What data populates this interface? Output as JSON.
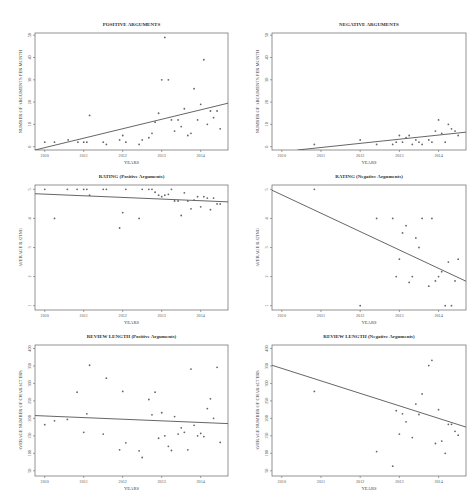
{
  "header_fragment": "",
  "chart_data": [
    {
      "id": "pos_args",
      "type": "scatter",
      "title": "POSITIVE ARGUMENTS",
      "xlabel": "YEARS",
      "ylabel": "NUMBER OF ARGUMENTS PER MONTH",
      "xticks": [
        2010,
        2011,
        2012,
        2013,
        2014
      ],
      "yticks": [
        0,
        10,
        20,
        30,
        40,
        50
      ],
      "xlim": [
        2009.75,
        2014.7
      ],
      "ylim": [
        -1.5,
        51
      ],
      "trend": [
        [
          2009.75,
          -1.5
        ],
        [
          2014.7,
          19.5
        ]
      ],
      "points": [
        [
          2010.0,
          2
        ],
        [
          2010.25,
          2
        ],
        [
          2010.6,
          3
        ],
        [
          2010.85,
          2
        ],
        [
          2011.0,
          2
        ],
        [
          2011.08,
          2
        ],
        [
          2011.15,
          14
        ],
        [
          2011.5,
          2
        ],
        [
          2011.58,
          1
        ],
        [
          2011.92,
          3
        ],
        [
          2012.0,
          5
        ],
        [
          2012.08,
          2
        ],
        [
          2012.42,
          1
        ],
        [
          2012.5,
          3
        ],
        [
          2012.67,
          4
        ],
        [
          2012.75,
          6
        ],
        [
          2012.83,
          11
        ],
        [
          2012.92,
          15
        ],
        [
          2013.0,
          30
        ],
        [
          2013.08,
          49
        ],
        [
          2013.17,
          30
        ],
        [
          2013.25,
          12
        ],
        [
          2013.33,
          7
        ],
        [
          2013.42,
          12
        ],
        [
          2013.5,
          9
        ],
        [
          2013.58,
          17
        ],
        [
          2013.67,
          5
        ],
        [
          2013.75,
          6
        ],
        [
          2013.83,
          26
        ],
        [
          2013.92,
          12
        ],
        [
          2014.0,
          19
        ],
        [
          2014.08,
          39
        ],
        [
          2014.17,
          10
        ],
        [
          2014.25,
          16
        ],
        [
          2014.33,
          13
        ],
        [
          2014.42,
          16
        ],
        [
          2014.5,
          8
        ]
      ]
    },
    {
      "id": "neg_args",
      "type": "scatter",
      "title": "NEGATIVE ARGUMENTS",
      "xlabel": "YEARS",
      "ylabel": "NUMBER OF ARGUMENTS PER MONTH",
      "xticks": [
        2010,
        2011,
        2012,
        2013,
        2014
      ],
      "yticks": [
        0,
        10,
        20,
        30,
        40,
        50
      ],
      "xlim": [
        2009.75,
        2014.7
      ],
      "ylim": [
        -1.5,
        51
      ],
      "trend": [
        [
          2010.4,
          -1.5
        ],
        [
          2014.7,
          6.5
        ]
      ],
      "points": [
        [
          2010.83,
          1
        ],
        [
          2012.0,
          3
        ],
        [
          2012.42,
          1
        ],
        [
          2012.83,
          1
        ],
        [
          2012.92,
          2
        ],
        [
          2013.0,
          5
        ],
        [
          2013.08,
          2
        ],
        [
          2013.17,
          4
        ],
        [
          2013.25,
          5
        ],
        [
          2013.33,
          1
        ],
        [
          2013.42,
          3
        ],
        [
          2013.5,
          2
        ],
        [
          2013.58,
          1
        ],
        [
          2013.75,
          3
        ],
        [
          2013.83,
          2
        ],
        [
          2013.92,
          7
        ],
        [
          2014.0,
          12
        ],
        [
          2014.08,
          6
        ],
        [
          2014.17,
          2
        ],
        [
          2014.25,
          10
        ],
        [
          2014.33,
          8
        ],
        [
          2014.42,
          7
        ],
        [
          2014.5,
          5
        ]
      ]
    },
    {
      "id": "rating_pos",
      "type": "scatter",
      "title": "RATING (Positive Arguments)",
      "xlabel": "YEARS",
      "ylabel": "AVERAGE RATING",
      "xticks": [
        2010,
        2011,
        2012,
        2013,
        2014
      ],
      "yticks": [
        1,
        2,
        3,
        4,
        5
      ],
      "ylim": [
        0.85,
        5.15
      ],
      "xlim": [
        2009.75,
        2014.7
      ],
      "trend": [
        [
          2009.75,
          4.85
        ],
        [
          2014.7,
          4.57
        ]
      ],
      "points": [
        [
          2010.0,
          5
        ],
        [
          2010.25,
          4
        ],
        [
          2010.58,
          5
        ],
        [
          2010.83,
          5
        ],
        [
          2011.0,
          5
        ],
        [
          2011.08,
          5
        ],
        [
          2011.15,
          4.8
        ],
        [
          2011.5,
          5
        ],
        [
          2011.58,
          5
        ],
        [
          2011.92,
          3.67
        ],
        [
          2012.0,
          4.2
        ],
        [
          2012.08,
          5
        ],
        [
          2012.42,
          4
        ],
        [
          2012.5,
          5
        ],
        [
          2012.67,
          5
        ],
        [
          2012.75,
          5
        ],
        [
          2012.83,
          4.9
        ],
        [
          2012.92,
          4.8
        ],
        [
          2013.0,
          4.75
        ],
        [
          2013.08,
          4.8
        ],
        [
          2013.17,
          4.83
        ],
        [
          2013.25,
          5
        ],
        [
          2013.33,
          4.6
        ],
        [
          2013.42,
          4.6
        ],
        [
          2013.5,
          4.1
        ],
        [
          2013.58,
          4.88
        ],
        [
          2013.67,
          4.6
        ],
        [
          2013.75,
          4.33
        ],
        [
          2013.83,
          4.63
        ],
        [
          2013.92,
          4.75
        ],
        [
          2014.0,
          4.4
        ],
        [
          2014.08,
          4.75
        ],
        [
          2014.17,
          4.7
        ],
        [
          2014.25,
          4.3
        ],
        [
          2014.33,
          4.7
        ],
        [
          2014.42,
          4.5
        ],
        [
          2014.5,
          4.5
        ]
      ]
    },
    {
      "id": "rating_neg",
      "type": "scatter",
      "title": "RATING (Negative Arguments)",
      "xlabel": "YEARS",
      "ylabel": "AVERAGE RATING",
      "xticks": [
        2010,
        2011,
        2012,
        2013,
        2014
      ],
      "yticks": [
        1,
        2,
        3,
        4,
        5
      ],
      "ylim": [
        0.85,
        5.15
      ],
      "xlim": [
        2009.75,
        2014.7
      ],
      "trend": [
        [
          2009.75,
          4.97
        ],
        [
          2014.7,
          1.84
        ]
      ],
      "points": [
        [
          2010.83,
          5
        ],
        [
          2012.0,
          1
        ],
        [
          2012.42,
          4
        ],
        [
          2012.83,
          4
        ],
        [
          2012.92,
          2
        ],
        [
          2013.0,
          2.6
        ],
        [
          2013.08,
          3.5
        ],
        [
          2013.17,
          3.75
        ],
        [
          2013.25,
          1.8
        ],
        [
          2013.33,
          2
        ],
        [
          2013.42,
          3.33
        ],
        [
          2013.5,
          3
        ],
        [
          2013.58,
          4
        ],
        [
          2013.75,
          1.67
        ],
        [
          2013.83,
          4
        ],
        [
          2013.92,
          1.85
        ],
        [
          2014.0,
          2
        ],
        [
          2014.08,
          2.17
        ],
        [
          2014.17,
          1
        ],
        [
          2014.25,
          2.5
        ],
        [
          2014.33,
          1
        ],
        [
          2014.42,
          1.85
        ],
        [
          2014.5,
          2.6
        ]
      ]
    },
    {
      "id": "len_pos",
      "type": "scatter",
      "title": "REVIEW LENGTH (Positive Arguments)",
      "xlabel": "YEARS",
      "ylabel": "AVERAGE NUMBER OF CHARACTERS",
      "xticks": [
        2010,
        2011,
        2012,
        2013,
        2014
      ],
      "yticks": [
        50,
        100,
        150,
        200,
        250,
        300,
        350,
        400
      ],
      "ylim": [
        35,
        410
      ],
      "xlim": [
        2009.75,
        2014.7
      ],
      "trend": [
        [
          2009.75,
          208
        ],
        [
          2014.7,
          185
        ]
      ],
      "points": [
        [
          2010.0,
          182
        ],
        [
          2010.25,
          193
        ],
        [
          2010.58,
          197
        ],
        [
          2010.83,
          275
        ],
        [
          2011.0,
          160
        ],
        [
          2011.08,
          213
        ],
        [
          2011.15,
          352
        ],
        [
          2011.5,
          155
        ],
        [
          2011.58,
          315
        ],
        [
          2011.92,
          110
        ],
        [
          2012.0,
          277
        ],
        [
          2012.08,
          130
        ],
        [
          2012.42,
          107
        ],
        [
          2012.5,
          88
        ],
        [
          2012.67,
          254
        ],
        [
          2012.75,
          210
        ],
        [
          2012.83,
          275
        ],
        [
          2012.92,
          143
        ],
        [
          2013.0,
          216
        ],
        [
          2013.08,
          150
        ],
        [
          2013.17,
          120
        ],
        [
          2013.25,
          108
        ],
        [
          2013.33,
          205
        ],
        [
          2013.42,
          155
        ],
        [
          2013.5,
          173
        ],
        [
          2013.58,
          160
        ],
        [
          2013.67,
          110
        ],
        [
          2013.75,
          341
        ],
        [
          2013.83,
          180
        ],
        [
          2013.92,
          150
        ],
        [
          2014.0,
          157
        ],
        [
          2014.08,
          148
        ],
        [
          2014.17,
          228
        ],
        [
          2014.25,
          256
        ],
        [
          2014.33,
          200
        ],
        [
          2014.42,
          346
        ],
        [
          2014.5,
          131
        ]
      ]
    },
    {
      "id": "len_neg",
      "type": "scatter",
      "title": "REVIEW LENGTH (Negative Arguments)",
      "xlabel": "YEARS",
      "ylabel": "AVERAGE NUMBER OF CHARACTERS",
      "xticks": [
        2010,
        2011,
        2012,
        2013,
        2014
      ],
      "yticks": [
        50,
        100,
        150,
        200,
        250,
        300,
        350,
        400
      ],
      "ylim": [
        35,
        410
      ],
      "xlim": [
        2009.75,
        2014.7
      ],
      "trend": [
        [
          2009.75,
          352
        ],
        [
          2014.7,
          175
        ]
      ],
      "points": [
        [
          2010.83,
          277
        ],
        [
          2012.42,
          105
        ],
        [
          2012.83,
          63
        ],
        [
          2012.92,
          222
        ],
        [
          2013.0,
          155
        ],
        [
          2013.08,
          213
        ],
        [
          2013.17,
          190
        ],
        [
          2013.33,
          145
        ],
        [
          2013.42,
          241
        ],
        [
          2013.5,
          211
        ],
        [
          2013.58,
          270
        ],
        [
          2013.75,
          351
        ],
        [
          2013.83,
          366
        ],
        [
          2013.92,
          128
        ],
        [
          2014.0,
          225
        ],
        [
          2014.08,
          135
        ],
        [
          2014.17,
          100
        ],
        [
          2014.25,
          183
        ],
        [
          2014.33,
          183
        ],
        [
          2014.42,
          163
        ],
        [
          2014.5,
          152
        ]
      ]
    }
  ]
}
